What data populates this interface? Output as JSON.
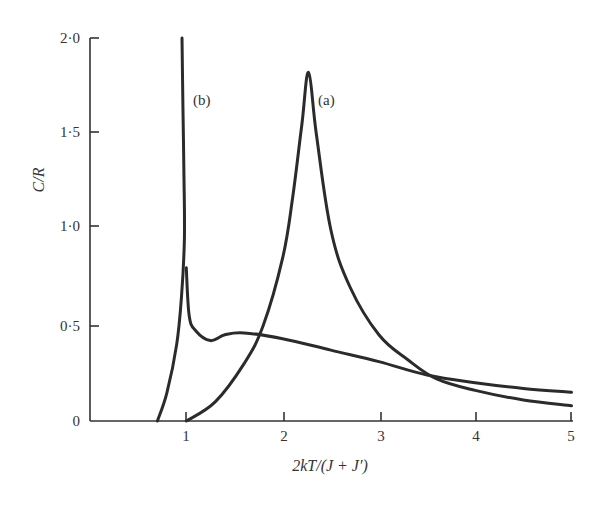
{
  "chart_data": {
    "type": "line",
    "title": "",
    "xlabel": "2kT/(J + J′)",
    "ylabel": "C/R",
    "xlim": [
      0,
      5
    ],
    "ylim": [
      0,
      2.0
    ],
    "x_ticks": [
      1,
      2,
      3,
      4,
      5
    ],
    "x_tick_labels": [
      "1",
      "2",
      "3",
      "4",
      "5"
    ],
    "y_ticks": [
      0,
      0.5,
      1.0,
      1.5,
      2.0
    ],
    "y_tick_labels": [
      "0",
      "0·5",
      "1·0",
      "1·5",
      "2·0"
    ],
    "grid": false,
    "legend": "none (inline curve labels)",
    "series": [
      {
        "name": "(a)",
        "x": [
          1.0,
          1.3,
          1.6,
          1.8,
          2.0,
          2.1,
          2.2,
          2.27,
          2.35,
          2.5,
          2.7,
          3.0,
          3.3,
          3.6,
          4.0,
          4.5,
          5.0
        ],
        "y": [
          0.0,
          0.1,
          0.3,
          0.5,
          0.85,
          1.15,
          1.55,
          1.82,
          1.5,
          1.0,
          0.7,
          0.45,
          0.32,
          0.22,
          0.16,
          0.11,
          0.08
        ]
      },
      {
        "name": "(b)",
        "branches": [
          {
            "part": "low-temperature branch diverging near x≈0.97",
            "x": [
              0.7,
              0.8,
              0.9,
              0.95,
              0.98,
              0.975,
              0.965,
              0.955
            ],
            "y": [
              0.0,
              0.15,
              0.4,
              0.65,
              0.95,
              1.3,
              1.65,
              2.0
            ]
          },
          {
            "part": "high-temperature branch",
            "x": [
              1.0,
              1.03,
              1.1,
              1.25,
              1.4,
              1.6,
              2.0,
              2.5,
              3.0,
              3.5,
              4.0,
              4.5,
              5.0
            ],
            "y": [
              0.8,
              0.55,
              0.47,
              0.42,
              0.45,
              0.46,
              0.43,
              0.37,
              0.31,
              0.24,
              0.2,
              0.17,
              0.15
            ]
          }
        ]
      }
    ],
    "annotations": [
      {
        "text": "(b)",
        "x": 1.1,
        "y": 1.72
      },
      {
        "text": "(a)",
        "x": 2.45,
        "y": 1.72
      }
    ]
  },
  "labels": {
    "xlabel": "2kT/(J + J′)",
    "ylabel": "C/R",
    "curve_a": "(a)",
    "curve_b": "(b)",
    "xticks": [
      "1",
      "2",
      "3",
      "4",
      "5"
    ],
    "yticks": [
      "0",
      "0·5",
      "1·0",
      "1·5",
      "2·0"
    ]
  }
}
